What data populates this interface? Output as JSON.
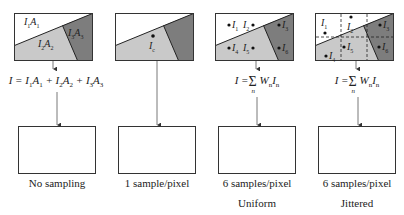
{
  "panels": [
    {
      "id": "no-sampling",
      "caption": "No sampling",
      "subcaption": "",
      "region_labels": [
        {
          "base": "I",
          "sub": "1",
          "base2": "A",
          "sub2": "1"
        },
        {
          "base": "I",
          "sub": "2",
          "base2": "A",
          "sub2": "2"
        },
        {
          "base": "I",
          "sub": "3",
          "base2": "A",
          "sub2": "3"
        }
      ],
      "equation": {
        "lhs": "I",
        "text": "I = I1A1 + I2A2 + I3A3"
      }
    },
    {
      "id": "one-sample",
      "caption": "1 sample/pixel",
      "subcaption": "",
      "sample_label": {
        "base": "I",
        "sub": "c"
      },
      "equation": null
    },
    {
      "id": "uniform",
      "caption": "6 samples/pixel",
      "subcaption": "Uniform",
      "samples": [
        "1",
        "2",
        "3",
        "4",
        "5",
        "6"
      ],
      "equation": {
        "lhs": "I",
        "sum_index": "n",
        "term": "W",
        "term_sub": "n",
        "term2": "I",
        "term2_sub": "n"
      }
    },
    {
      "id": "jittered",
      "caption": "6 samples/pixel",
      "subcaption": "Jittered",
      "samples": [
        "1",
        "2",
        "3",
        "4",
        "5",
        "6"
      ],
      "equation": {
        "lhs": "I",
        "sum_index": "n",
        "term": "W",
        "term_sub": "n",
        "term2": "I",
        "term2_sub": "n"
      }
    }
  ],
  "colors": {
    "region_white": "#ffffff",
    "region_light": "#c9c9c9",
    "region_dark": "#7d7d7d",
    "stroke": "#333333"
  }
}
